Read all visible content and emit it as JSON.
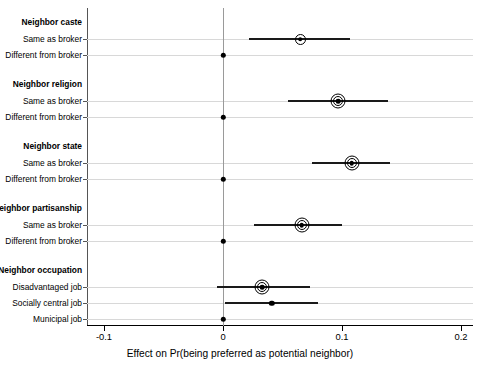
{
  "chart_data": {
    "type": "scatter",
    "subtype": "coefficient-dot-plot-with-confidence-intervals",
    "title": "",
    "xlabel": "Effect on Pr(being preferred as potential neighbor)",
    "ylabel": "",
    "xlim": [
      -0.13,
      0.225
    ],
    "xticks": [
      -0.1,
      0,
      0.1,
      0.2
    ],
    "xticklabels": [
      "-0.1",
      "0",
      "0.1",
      "0.2"
    ],
    "grid": true,
    "grid_axis": "y",
    "reference_line": 0,
    "legend": "none",
    "groups": [
      {
        "name": "Neighbor caste",
        "rows": [
          {
            "label": "Same as broker",
            "estimate": 0.065,
            "ci_low": 0.022,
            "ci_high": 0.107,
            "marker": "circle-single-ring",
            "is_baseline": false
          },
          {
            "label": "Different from broker",
            "estimate": 0.0,
            "ci_low": 0.0,
            "ci_high": 0.0,
            "marker": "dot",
            "is_baseline": true
          }
        ]
      },
      {
        "name": "Neighbor religion",
        "rows": [
          {
            "label": "Same as broker",
            "estimate": 0.097,
            "ci_low": 0.055,
            "ci_high": 0.139,
            "marker": "circle-double-ring",
            "is_baseline": false
          },
          {
            "label": "Different from broker",
            "estimate": 0.0,
            "ci_low": 0.0,
            "ci_high": 0.0,
            "marker": "dot",
            "is_baseline": true
          }
        ]
      },
      {
        "name": "Neighbor state",
        "rows": [
          {
            "label": "Same as broker",
            "estimate": 0.108,
            "ci_low": 0.075,
            "ci_high": 0.14,
            "marker": "circle-double-ring",
            "is_baseline": false
          },
          {
            "label": "Different from broker",
            "estimate": 0.0,
            "ci_low": 0.0,
            "ci_high": 0.0,
            "marker": "dot",
            "is_baseline": true
          }
        ]
      },
      {
        "name": "Neighbor partisanship",
        "rows": [
          {
            "label": "Same as broker",
            "estimate": 0.066,
            "ci_low": 0.026,
            "ci_high": 0.1,
            "marker": "circle-double-ring",
            "is_baseline": false
          },
          {
            "label": "Different from broker",
            "estimate": 0.0,
            "ci_low": 0.0,
            "ci_high": 0.0,
            "marker": "dot",
            "is_baseline": true
          }
        ]
      },
      {
        "name": "Neighbor occupation",
        "rows": [
          {
            "label": "Disadvantaged job",
            "estimate": 0.033,
            "ci_low": -0.005,
            "ci_high": 0.073,
            "marker": "circle-double-ring",
            "is_baseline": false
          },
          {
            "label": "Socially central job",
            "estimate": 0.041,
            "ci_low": 0.002,
            "ci_high": 0.08,
            "marker": "dot",
            "is_baseline": false
          },
          {
            "label": "Municipal job",
            "estimate": 0.0,
            "ci_low": 0.0,
            "ci_high": 0.0,
            "marker": "dot",
            "is_baseline": true
          }
        ]
      }
    ]
  },
  "colors": {
    "background": "#ffffff",
    "marker": "#000000",
    "ci_bar": "#1a1a1a",
    "gridline": "#d8d8d8",
    "zero_line": "#9a9a9a",
    "axis": "#000000"
  }
}
